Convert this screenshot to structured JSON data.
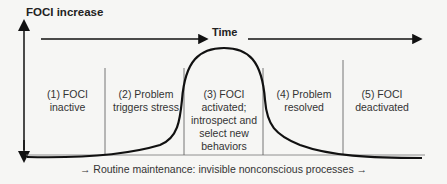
{
  "diagram": {
    "y_axis_label": "FOCI increase",
    "time_label": "Time",
    "phases": [
      {
        "label": "(1) FOCI inactive"
      },
      {
        "label": "(2) Problem triggers stress"
      },
      {
        "label": "(3) FOCI activated; introspect and select new behaviors"
      },
      {
        "label": "(4) Problem resolved"
      },
      {
        "label": "(5) FOCI deactivated"
      }
    ],
    "footer": "→ Routine maintenance: invisible nonconscious processes →",
    "colors": {
      "line": "#111111",
      "divider": "#555555",
      "background": "#f6f6f4"
    }
  }
}
